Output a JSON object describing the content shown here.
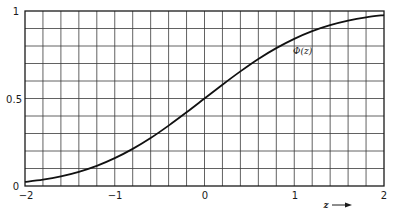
{
  "chart_data": {
    "type": "line",
    "title": "",
    "xlabel": "z",
    "ylabel": "",
    "xlim": [
      -2,
      2
    ],
    "ylim": [
      0,
      1
    ],
    "grid": true,
    "grid_x_step": 0.2,
    "grid_y_step": 0.1,
    "x_ticks": [
      -2,
      -1,
      0,
      1,
      2
    ],
    "x_tick_labels": [
      "−2",
      "−1",
      "0",
      "1",
      "2"
    ],
    "y_ticks": [
      0,
      0.5,
      1
    ],
    "y_tick_labels": [
      "0",
      "0.5",
      "1"
    ],
    "series": [
      {
        "name": "Φ(z)",
        "label": "Φ(z)",
        "x": [
          -2.0,
          -1.8,
          -1.6,
          -1.4,
          -1.2,
          -1.0,
          -0.8,
          -0.6,
          -0.4,
          -0.2,
          0.0,
          0.2,
          0.4,
          0.6,
          0.8,
          1.0,
          1.2,
          1.4,
          1.6,
          1.8,
          2.0
        ],
        "values": [
          0.023,
          0.036,
          0.055,
          0.081,
          0.115,
          0.159,
          0.212,
          0.274,
          0.345,
          0.421,
          0.5,
          0.579,
          0.655,
          0.726,
          0.788,
          0.841,
          0.885,
          0.919,
          0.945,
          0.964,
          0.977
        ]
      }
    ],
    "annotations": [
      {
        "text": "Φ(z)",
        "x": 1.0,
        "y": 0.79
      },
      {
        "text": "z →",
        "position": "below x-axis near z=1.2"
      }
    ],
    "legend": "none"
  },
  "labels": {
    "series_label": "Φ(z)",
    "x_axis_label": "z",
    "y_ticks": [
      "0",
      "0.5",
      "1"
    ],
    "x_ticks": [
      "−2",
      "−1",
      "0",
      "1",
      "2"
    ]
  }
}
